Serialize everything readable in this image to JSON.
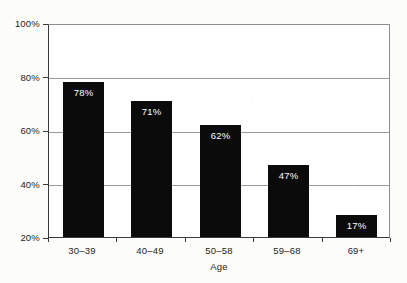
{
  "chart_data": {
    "type": "bar",
    "title": "",
    "xlabel": "Age",
    "ylabel": "",
    "categories": [
      "30–39",
      "40–49",
      "50–58",
      "59–68",
      "69+"
    ],
    "values": [
      78,
      71,
      62,
      47,
      17
    ],
    "value_labels": [
      "78%",
      "71%",
      "62%",
      "47%",
      "17%"
    ],
    "ylim": [
      20,
      100
    ],
    "y_ticks": [
      20,
      40,
      60,
      80,
      100
    ],
    "y_tick_labels": [
      "20%",
      "40%",
      "60%",
      "80%",
      "100%"
    ],
    "grid": "horizontal",
    "legend": "none",
    "bar_color": "#0b0b0b",
    "value_label_color": "#ffffff",
    "gridline_color": "#9a9a9a",
    "axis_color": "#3a3a3a",
    "plot_background": "#ffffff",
    "figure_background": "#fcfcfa"
  }
}
